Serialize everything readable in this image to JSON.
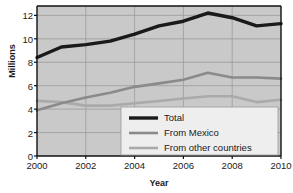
{
  "chart_data": {
    "type": "line",
    "title": "",
    "xlabel": "Year",
    "ylabel": "Millions",
    "x": [
      2000,
      2001,
      2002,
      2003,
      2004,
      2005,
      2006,
      2007,
      2008,
      2009,
      2010
    ],
    "xlim": [
      2000,
      2010
    ],
    "ylim": [
      0,
      12.8
    ],
    "xticks": [
      "2000",
      "2002",
      "2004",
      "2006",
      "2008",
      "2010"
    ],
    "xtick_values": [
      2000,
      2002,
      2004,
      2006,
      2008,
      2010
    ],
    "yticks": [
      "0",
      "2",
      "4",
      "6",
      "8",
      "10",
      "12"
    ],
    "ytick_values": [
      0,
      2,
      4,
      6,
      8,
      10,
      12
    ],
    "grid": true,
    "legend_position": "lower-center-right",
    "plot_background": "#c9c9c9",
    "grid_color": "#9a9a9a",
    "series": [
      {
        "name": "Total",
        "color": "#1a1a1a",
        "width": 3.4,
        "values": [
          8.4,
          9.3,
          9.5,
          9.8,
          10.4,
          11.1,
          11.5,
          12.2,
          11.8,
          11.1,
          11.3
        ]
      },
      {
        "name": "From Mexico",
        "color": "#8a8a8a",
        "width": 2.6,
        "values": [
          3.9,
          4.5,
          5.0,
          5.4,
          5.9,
          6.2,
          6.5,
          7.1,
          6.7,
          6.7,
          6.6
        ]
      },
      {
        "name": "From other countries",
        "color": "#aaaaaa",
        "width": 2.6,
        "values": [
          4.7,
          4.6,
          4.3,
          4.3,
          4.5,
          4.7,
          4.9,
          5.1,
          5.1,
          4.6,
          4.8
        ]
      }
    ]
  },
  "legend": {
    "items": [
      {
        "label": "Total"
      },
      {
        "label": "From Mexico"
      },
      {
        "label": "From other countries"
      }
    ]
  },
  "axes": {
    "y_title": "Millions",
    "x_title": "Year"
  }
}
